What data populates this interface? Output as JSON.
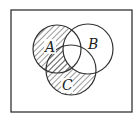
{
  "diagram": {
    "type": "venn",
    "sets": [
      {
        "label": "A",
        "cx": 57,
        "cy": 49,
        "r": 24,
        "label_x": 47,
        "label_y": 52
      },
      {
        "label": "B",
        "cx": 88,
        "cy": 49,
        "r": 25,
        "label_x": 87,
        "label_y": 49
      },
      {
        "label": "C",
        "cx": 71,
        "cy": 70,
        "r": 25,
        "label_x": 63,
        "label_y": 90
      }
    ],
    "shaded_region": "(A ∪ C) − B",
    "universe": {
      "x": 11,
      "y": 10,
      "width": 121,
      "height": 102
    },
    "colors": {
      "stroke": "#333333",
      "hatch": "#333333",
      "background": "#ffffff"
    }
  }
}
